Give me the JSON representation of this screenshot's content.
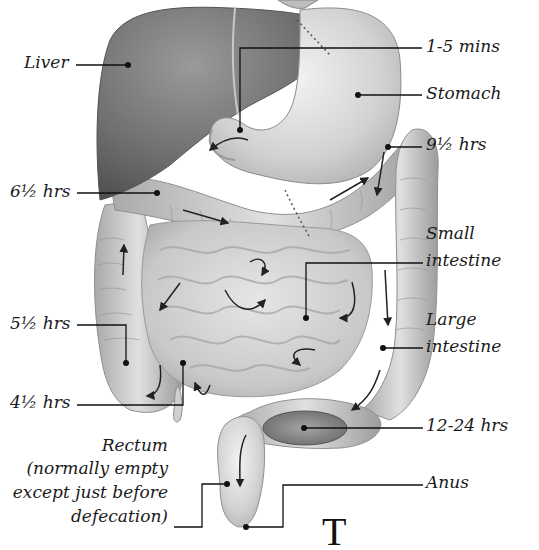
{
  "diagram": {
    "labels": {
      "liver": "Liver",
      "one_five_mins": "1-5 mins",
      "stomach": "Stomach",
      "nine_half_hrs": "9½ hrs",
      "six_half_hrs": "6½ hrs",
      "small_intestine_1": "Small",
      "small_intestine_2": "intestine",
      "five_half_hrs": "5½ hrs",
      "large_intestine_1": "Large",
      "large_intestine_2": "intestine",
      "four_half_hrs": "4½ hrs",
      "twelve_24_hrs": "12-24 hrs",
      "rectum_1": "Rectum",
      "rectum_2": "(normally empty",
      "rectum_3": "except just before",
      "rectum_4": "defecation)",
      "anus": "Anus"
    },
    "partial_text": "T",
    "colors": {
      "liver": "#6e6e6e",
      "stomach": "#d4d4d4",
      "intestine": "#c9c9c9",
      "feces": "#8a8a8a",
      "leader": "#111111",
      "background": "#ffffff"
    }
  }
}
